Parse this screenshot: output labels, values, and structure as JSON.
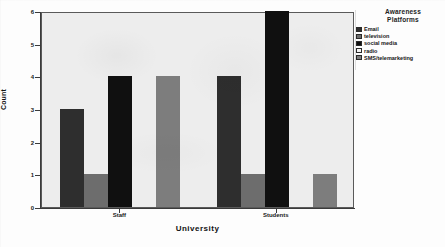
{
  "chart_data": {
    "type": "bar",
    "title": "",
    "subtitle": "",
    "xlabel": "University",
    "ylabel": "Count",
    "categories": [
      "Staff",
      "Students"
    ],
    "ylim": [
      0,
      6
    ],
    "yticks": [
      "0",
      "1",
      "2",
      "3",
      "4",
      "5",
      "6"
    ],
    "grid": false,
    "legend_position": "right",
    "legend_title": "Awareness Platforms",
    "series": [
      {
        "name": "Email",
        "color": "#2e2e2e",
        "values": [
          3,
          4
        ]
      },
      {
        "name": "television",
        "color": "#6d6d6d",
        "values": [
          1,
          1
        ]
      },
      {
        "name": "social media",
        "color": "#101010",
        "values": [
          4,
          6
        ]
      },
      {
        "name": "radio",
        "color": "#f2f2f2",
        "values": [
          0,
          0
        ]
      },
      {
        "name": "SMS/telemarketing",
        "color": "#7d7d7d",
        "values": [
          4,
          1
        ]
      }
    ]
  },
  "legend": {
    "title_line1": "Awareness",
    "title_line2": "Platforms",
    "items": [
      {
        "label": "Email",
        "color": "#2e2e2e"
      },
      {
        "label": "television",
        "color": "#6d6d6d"
      },
      {
        "label": "social media",
        "color": "#101010"
      },
      {
        "label": "radio",
        "color": "#f4f4f4"
      },
      {
        "label": "SMS/telemarketing",
        "color": "#7d7d7d"
      }
    ]
  },
  "axes": {
    "y_title": "Count",
    "x_title": "University",
    "y_ticks": [
      "6",
      "5",
      "4",
      "3",
      "2",
      "1",
      "0"
    ],
    "x_ticks": [
      "Staff",
      "Students"
    ]
  },
  "colors": {
    "plot_background": "#ededed",
    "page_background": "#fdfdfd",
    "axis": "#3a3a3a",
    "text": "#111111"
  }
}
